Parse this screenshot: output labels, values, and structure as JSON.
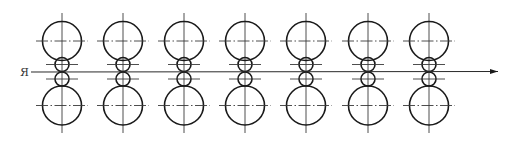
{
  "diagram": {
    "type": "rolling-mill-stand-sequence",
    "stand_count": 7,
    "stand_centers_x": [
      62,
      123,
      184,
      245,
      306,
      368,
      429
    ],
    "backup_roll": {
      "radius": 19.5,
      "top_center_y": 41,
      "bottom_center_y": 105.5
    },
    "work_roll": {
      "radius": 7,
      "top_center_y": 64.5,
      "bottom_center_y": 79
    },
    "strip": {
      "start_x": 31,
      "end_x": 498,
      "y": 72,
      "direction": "right"
    },
    "entry_label": "Я",
    "colors": {
      "line": "#1a1a1a",
      "centerline": "#3a3a3a",
      "background": "#ffffff"
    }
  }
}
